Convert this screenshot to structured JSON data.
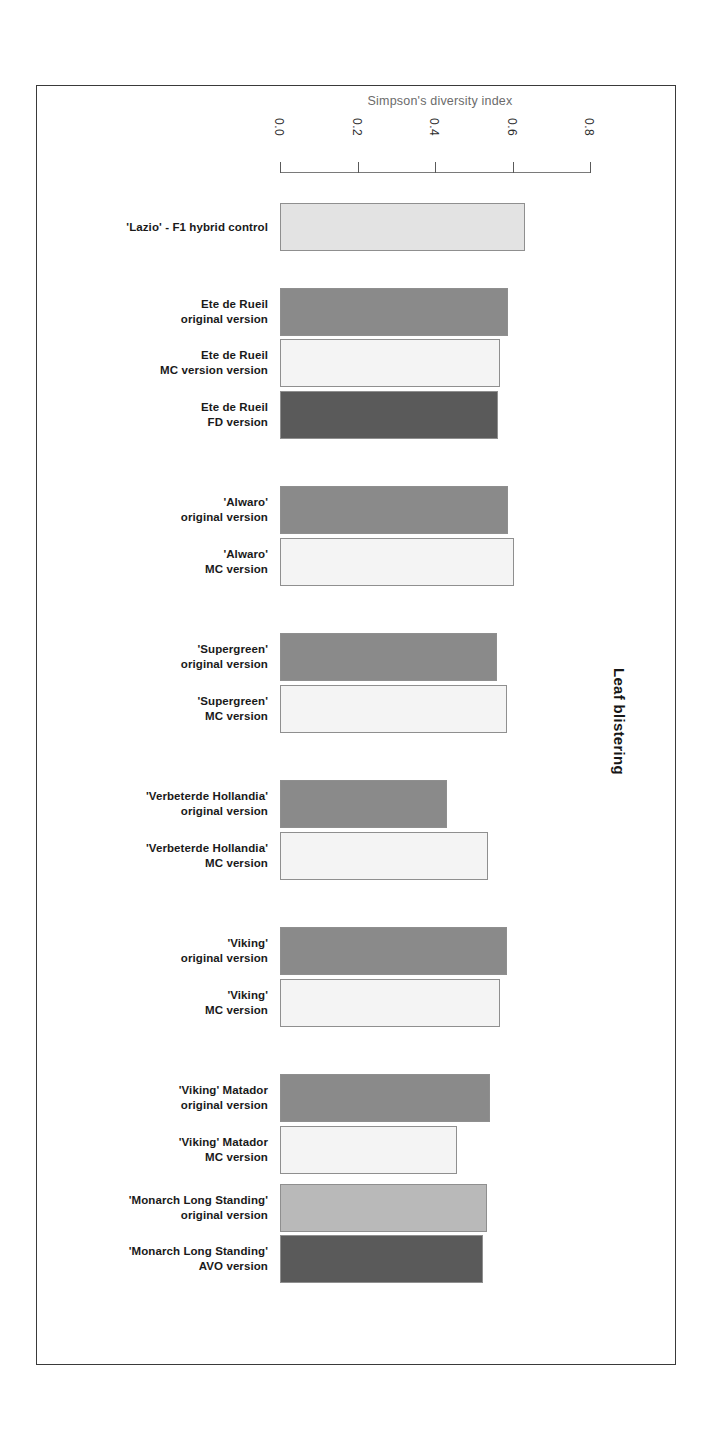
{
  "figure": {
    "group_label": "Leaf blistering",
    "frame_color": "#3a3a3a"
  },
  "axis": {
    "title": "Simpson's diversity index",
    "ticks": [
      "0.0",
      "0.2",
      "0.4",
      "0.6",
      "0.8"
    ],
    "tick_values": [
      0.0,
      0.2,
      0.4,
      0.6,
      0.8
    ]
  },
  "palette": {
    "very_light": "#f4f4f4",
    "light": "#e3e3e3",
    "light_mid": "#b9b9b9",
    "mid": "#8a8a8a",
    "dark": "#5a5a5a",
    "outline": "#8f8f8f"
  },
  "chart_data": {
    "type": "bar",
    "orientation": "horizontal",
    "title": "",
    "xlabel": "Simpson's diversity index",
    "ylabel": "Leaf blistering",
    "xlim": [
      0.0,
      0.8
    ],
    "xticks": [
      0.0,
      0.2,
      0.4,
      0.6,
      0.8
    ],
    "grid": false,
    "legend": null,
    "categories": [
      "'Lazio' - F1 hybrid control",
      "Ete de Rueil original version",
      "Ete de Rueil MC version version",
      "Ete de Rueil FD version",
      "'Alwaro' original version",
      "'Alwaro' MC version",
      "'Supergreen' original version",
      "'Supergreen' MC version",
      "'Verbeterde Hollandia' original version",
      "'Verbeterde Hollandia' MC version",
      "'Viking' original version",
      "'Viking' MC version",
      "'Viking' Matador original version",
      "'Viking' Matador MC version",
      "'Monarch Long Standing' original version",
      "'Monarch Long Standing' AVO version"
    ],
    "values": [
      0.632,
      0.588,
      0.568,
      0.563,
      0.588,
      0.604,
      0.56,
      0.586,
      0.431,
      0.537,
      0.586,
      0.568,
      0.542,
      0.457,
      0.534,
      0.524
    ]
  },
  "bars": [
    {
      "label_lines": [
        "'Lazio' - F1 hybrid control"
      ],
      "value": 0.632,
      "fill": "#e3e3e3",
      "top": 202,
      "width_px": 245
    },
    {
      "label_lines": [
        "Ete de Rueil",
        "original version"
      ],
      "value": 0.588,
      "fill": "#8a8a8a",
      "top": 287,
      "width_px": 228
    },
    {
      "label_lines": [
        "Ete de Rueil",
        "MC version version"
      ],
      "value": 0.568,
      "fill": "#f4f4f4",
      "top": 338,
      "width_px": 220
    },
    {
      "label_lines": [
        "Ete de Rueil",
        "FD version"
      ],
      "value": 0.563,
      "fill": "#5a5a5a",
      "top": 390,
      "width_px": 218
    },
    {
      "label_lines": [
        "'Alwaro'",
        "original version"
      ],
      "value": 0.588,
      "fill": "#8a8a8a",
      "top": 485,
      "width_px": 228
    },
    {
      "label_lines": [
        "'Alwaro'",
        "MC version"
      ],
      "value": 0.604,
      "fill": "#f4f4f4",
      "top": 537,
      "width_px": 234
    },
    {
      "label_lines": [
        "'Supergreen'",
        "original version"
      ],
      "value": 0.56,
      "fill": "#8a8a8a",
      "top": 632,
      "width_px": 217
    },
    {
      "label_lines": [
        "'Supergreen'",
        "MC version"
      ],
      "value": 0.586,
      "fill": "#f4f4f4",
      "top": 684,
      "width_px": 227
    },
    {
      "label_lines": [
        "'Verbeterde Hollandia'",
        "original version"
      ],
      "value": 0.431,
      "fill": "#8a8a8a",
      "top": 779,
      "width_px": 167
    },
    {
      "label_lines": [
        "'Verbeterde Hollandia'",
        "MC version"
      ],
      "value": 0.537,
      "fill": "#f4f4f4",
      "top": 831,
      "width_px": 208
    },
    {
      "label_lines": [
        "'Viking'",
        "original version"
      ],
      "value": 0.586,
      "fill": "#8a8a8a",
      "top": 926,
      "width_px": 227
    },
    {
      "label_lines": [
        "'Viking'",
        "MC version"
      ],
      "value": 0.568,
      "fill": "#f4f4f4",
      "top": 978,
      "width_px": 220
    },
    {
      "label_lines": [
        "'Viking' Matador",
        "original version"
      ],
      "value": 0.542,
      "fill": "#8a8a8a",
      "top": 1073,
      "width_px": 210
    },
    {
      "label_lines": [
        "'Viking' Matador",
        "MC version"
      ],
      "value": 0.457,
      "fill": "#f4f4f4",
      "top": 1125,
      "width_px": 177
    },
    {
      "label_lines": [
        "'Monarch Long Standing'",
        "original version"
      ],
      "value": 0.534,
      "fill": "#b9b9b9",
      "top": 1183,
      "width_px": 207
    },
    {
      "label_lines": [
        "'Monarch Long Standing'",
        "AVO version"
      ],
      "value": 0.524,
      "fill": "#5a5a5a",
      "top": 1234,
      "width_px": 203
    }
  ]
}
